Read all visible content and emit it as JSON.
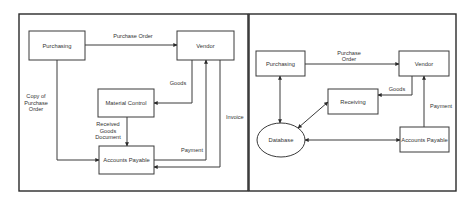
{
  "left_diagram": {
    "nodes": {
      "purchasing": "Purchasing",
      "vendor": "Vendor",
      "material_control": "Material Control",
      "accounts_payable": "Accounts Payable"
    },
    "edges": {
      "purchase_order": "Purchase Order",
      "goods": "Goods",
      "copy_line1": "Copy of",
      "copy_line2": "Purchase",
      "copy_line3": "Order",
      "rgd_line1": "Received",
      "rgd_line2": "Goods",
      "rgd_line3": "Document",
      "payment": "Payment",
      "invoice": "Invoice"
    }
  },
  "right_diagram": {
    "nodes": {
      "purchasing": "Purchasing",
      "vendor": "Vendor",
      "receiving": "Receiving",
      "database": "Database",
      "accounts_payable": "Accounts Payable"
    },
    "edges": {
      "po_line1": "Purchase",
      "po_line2": "Order",
      "goods": "Goods",
      "payment": "Payment"
    }
  },
  "colors": {
    "stroke": "#3a3a3a",
    "text": "#333333",
    "background": "#ffffff"
  }
}
